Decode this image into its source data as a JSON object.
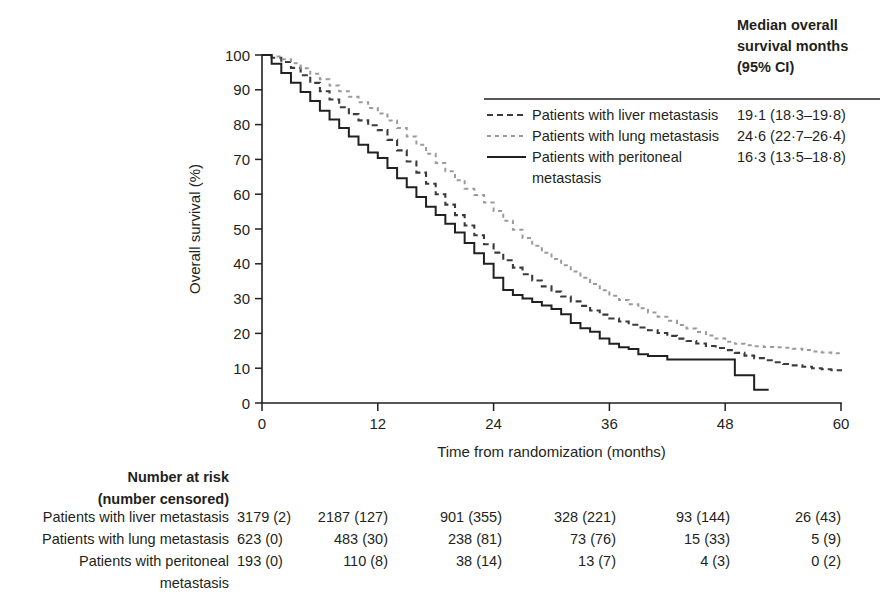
{
  "figure": {
    "name": "kaplan-meier-overall-survival",
    "background": "#ffffff",
    "ink": "#231f20"
  },
  "chart_data": {
    "type": "line",
    "title": "",
    "xlabel": "Time from randomization (months)",
    "ylabel": "Overall survival (%)",
    "xlim": [
      0,
      60
    ],
    "ylim": [
      0,
      100
    ],
    "xticks": [
      0,
      12,
      24,
      36,
      48,
      60
    ],
    "xtick_labels": [
      "0",
      "12",
      "24",
      "36",
      "48",
      "60"
    ],
    "yticks": [
      0,
      10,
      20,
      30,
      40,
      50,
      60,
      70,
      80,
      90,
      100
    ],
    "ytick_labels": [
      "0",
      "10",
      "20",
      "30",
      "40",
      "50",
      "60",
      "70",
      "80",
      "90",
      "100"
    ],
    "grid": false,
    "legend_position": "top-right",
    "series": [
      {
        "name": "Patients with liver metastasis",
        "style": "dashed",
        "color": "#3b3b3b",
        "dash": "6,4",
        "width": 2.1,
        "x": [
          0,
          1,
          2,
          3,
          4,
          5,
          6,
          7,
          8,
          9,
          10,
          11,
          12,
          13,
          14,
          15,
          16,
          17,
          18,
          19,
          20,
          21,
          22,
          23,
          24,
          25,
          26,
          27,
          28,
          29,
          30,
          31,
          32,
          33,
          34,
          35,
          36,
          37,
          38,
          39,
          40,
          41,
          42,
          43,
          44,
          45,
          46,
          47,
          48,
          49,
          50,
          51,
          52,
          53,
          54,
          55,
          56,
          57,
          58,
          59,
          60
        ],
        "y": [
          100,
          99.2,
          98.0,
          96.3,
          94.2,
          92.0,
          89.6,
          87.2,
          85.0,
          83.0,
          81.2,
          79.8,
          78.4,
          75.6,
          72.6,
          69.4,
          66.2,
          63.0,
          60.0,
          57.0,
          54.0,
          51.0,
          48.2,
          45.6,
          43.2,
          41.0,
          38.9,
          37.0,
          35.2,
          33.5,
          32.0,
          30.6,
          29.2,
          27.9,
          26.6,
          25.4,
          24.3,
          23.4,
          22.5,
          21.7,
          20.9,
          20.1,
          19.3,
          18.5,
          17.8,
          17.1,
          16.4,
          15.8,
          15.2,
          14.4,
          13.6,
          12.9,
          12.3,
          11.7,
          11.2,
          10.8,
          10.4,
          10.0,
          9.7,
          9.4,
          9.1
        ]
      },
      {
        "name": "Patients with lung metastasis",
        "style": "dotted",
        "color": "#9a9a9a",
        "dash": "4,4",
        "width": 2.0,
        "x": [
          0,
          1,
          2,
          3,
          4,
          5,
          6,
          7,
          8,
          9,
          10,
          11,
          12,
          13,
          14,
          15,
          16,
          17,
          18,
          19,
          20,
          21,
          22,
          23,
          24,
          25,
          26,
          27,
          28,
          29,
          30,
          31,
          32,
          33,
          34,
          35,
          36,
          37,
          38,
          39,
          40,
          41,
          42,
          43,
          44,
          45,
          46,
          47,
          48,
          49,
          50,
          51,
          52,
          53,
          54,
          55,
          56,
          57,
          58,
          59,
          60
        ],
        "y": [
          100,
          99.6,
          98.8,
          97.6,
          96.2,
          94.6,
          93.0,
          91.2,
          89.6,
          88.0,
          86.4,
          84.8,
          83.2,
          81.2,
          79.0,
          76.6,
          74.2,
          71.6,
          69.0,
          66.6,
          64.0,
          61.6,
          59.8,
          57.6,
          55.2,
          52.4,
          49.8,
          47.4,
          45.2,
          43.2,
          41.4,
          39.6,
          37.8,
          36.0,
          34.2,
          32.4,
          30.8,
          29.6,
          28.4,
          27.2,
          26.0,
          24.8,
          23.6,
          22.4,
          21.4,
          20.4,
          19.4,
          18.5,
          17.6,
          17.0,
          16.6,
          16.3,
          16.1,
          16.0,
          15.9,
          15.6,
          15.2,
          14.8,
          14.5,
          14.3,
          14.2
        ]
      },
      {
        "name": "Patients with peritoneal metastasis",
        "style": "solid",
        "color": "#231f20",
        "dash": "",
        "width": 2.0,
        "x": [
          0,
          1,
          2,
          3,
          4,
          5,
          6,
          7,
          8,
          9,
          10,
          11,
          12,
          13,
          14,
          15,
          16,
          17,
          18,
          19,
          20,
          21,
          22,
          23,
          24,
          25,
          26,
          27,
          28,
          29,
          30,
          31,
          32,
          33,
          34,
          35,
          36,
          37,
          38,
          39,
          40,
          41,
          42,
          43,
          44,
          45,
          46,
          47,
          48,
          49,
          50,
          51,
          52.5
        ],
        "y": [
          100,
          97.5,
          94.8,
          92.0,
          89.4,
          86.8,
          84.0,
          81.5,
          79.0,
          76.6,
          74.2,
          72.0,
          70.4,
          67.5,
          64.6,
          62.0,
          59.2,
          56.4,
          54.0,
          51.5,
          49.0,
          46.0,
          43.0,
          40.0,
          36.0,
          32.5,
          31.0,
          30.0,
          29.0,
          28.0,
          27.0,
          25.5,
          23.0,
          21.5,
          20.5,
          18.5,
          17.0,
          16.0,
          15.5,
          14.0,
          13.5,
          13.5,
          12.5,
          12.5,
          12.5,
          12.5,
          12.5,
          12.5,
          12.5,
          8.0,
          8.0,
          3.8,
          3.8
        ]
      }
    ]
  },
  "legend": {
    "header_lines": [
      "Median overall",
      "survival months",
      "(95% CI)"
    ],
    "rows": [
      {
        "label_lines": [
          "Patients with liver metastasis"
        ],
        "value": "19·1 (18·3–19·8)",
        "sample": "dashed-dark"
      },
      {
        "label_lines": [
          "Patients with lung metastasis"
        ],
        "value": "24·6 (22·7–26·4)",
        "sample": "dashed-light"
      },
      {
        "label_lines": [
          "Patients with peritoneal",
          "metastasis"
        ],
        "value": "16·3 (13·5–18·8)",
        "sample": "solid-dark"
      }
    ]
  },
  "risk_table": {
    "title_lines": [
      "Number at risk",
      "(number censored)"
    ],
    "column_times": [
      0,
      12,
      24,
      36,
      48,
      60
    ],
    "rows": [
      {
        "label_lines": [
          "Patients with liver metastasis"
        ],
        "values": [
          "3179 (2)",
          "2187 (127)",
          "901 (355)",
          "328 (221)",
          "93 (144)",
          "26 (43)"
        ]
      },
      {
        "label_lines": [
          "Patients with lung metastasis"
        ],
        "values": [
          "623 (0)",
          "483 (30)",
          "238 (81)",
          "73 (76)",
          "15 (33)",
          "5 (9)"
        ]
      },
      {
        "label_lines": [
          "Patients with peritoneal",
          "metastasis"
        ],
        "values": [
          "193 (0)",
          "110 (8)",
          "38 (14)",
          "13 (7)",
          "4 (3)",
          "0 (2)"
        ]
      }
    ]
  }
}
